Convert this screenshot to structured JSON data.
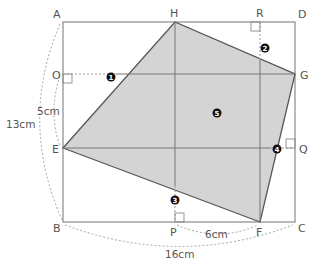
{
  "diagram": {
    "colors": {
      "fill": "#d4d4d4",
      "stroke": "#555555",
      "rect_stroke": "#8a8a8a",
      "dashed": "#9a9a9a",
      "badge": "#111111"
    },
    "points": {
      "A": "A",
      "B": "B",
      "C": "C",
      "D": "D",
      "E": "E",
      "F": "F",
      "G": "G",
      "H": "H",
      "O": "O",
      "P": "P",
      "Q": "Q",
      "R": "R"
    },
    "measurements": {
      "AE": "13cm",
      "OE": "5cm",
      "PF": "6cm",
      "BC": "16cm"
    },
    "regions": {
      "r1": "1",
      "r2": "2",
      "r3": "3",
      "r4": "4",
      "r5": "5"
    }
  }
}
